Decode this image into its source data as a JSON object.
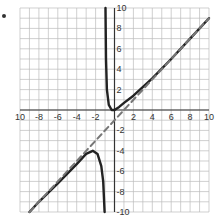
{
  "chart_data": {
    "type": "line",
    "title": "",
    "xlabel": "",
    "ylabel": "",
    "xlim": [
      -10,
      10
    ],
    "ylim": [
      -10,
      10
    ],
    "grid": true,
    "x_tick_labels": [
      "10",
      "-8",
      "-6",
      "-4",
      "-2",
      "2",
      "4",
      "6",
      "8",
      "10"
    ],
    "y_tick_labels": [
      "10",
      "8",
      "6",
      "4",
      "2",
      "-2",
      "-4",
      "-6",
      "-8",
      "-10"
    ],
    "vertical_asymptote": -1,
    "series": [
      {
        "name": "right branch",
        "style": "solid",
        "points": [
          [
            -0.95,
            10
          ],
          [
            -0.9,
            5
          ],
          [
            -0.8,
            2
          ],
          [
            -0.6,
            0.5
          ],
          [
            -0.3,
            0
          ],
          [
            0,
            0
          ],
          [
            0.5,
            0.3
          ],
          [
            1,
            0.7
          ],
          [
            2,
            1.4
          ],
          [
            4,
            3.1
          ],
          [
            6,
            5
          ],
          [
            8,
            7
          ],
          [
            10,
            9
          ]
        ]
      },
      {
        "name": "left branch",
        "style": "solid",
        "points": [
          [
            -9,
            -10
          ],
          [
            -8,
            -9
          ],
          [
            -6,
            -7.2
          ],
          [
            -4,
            -5.3
          ],
          [
            -3,
            -4.3
          ],
          [
            -2.3,
            -4
          ],
          [
            -1.8,
            -4.3
          ],
          [
            -1.4,
            -5.5
          ],
          [
            -1.2,
            -7
          ],
          [
            -1.05,
            -10
          ]
        ]
      },
      {
        "name": "slant asymptote",
        "style": "dashed",
        "points": [
          [
            -9,
            -10
          ],
          [
            10,
            9
          ]
        ]
      }
    ]
  },
  "marker": "bullet"
}
